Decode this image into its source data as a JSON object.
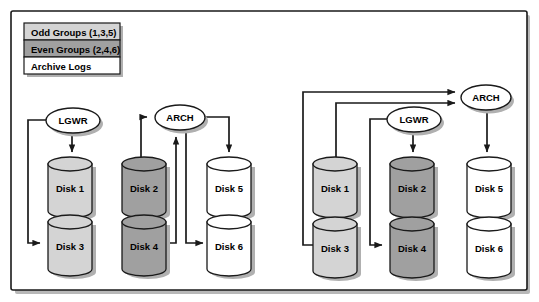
{
  "figure": {
    "colors": {
      "odd_group_fill": "#d4d4d4",
      "even_group_fill": "#a0a0a0",
      "archive_log_fill": "#ffffff",
      "outline": "#1a1a1a",
      "shadow": "#b0b0b0",
      "background": "#ffffff"
    }
  },
  "legend": {
    "items": [
      {
        "label": "Odd Groups (1,3,5)",
        "swatch": "#d4d4d4"
      },
      {
        "label": "Even Groups (2,4,6)",
        "swatch": "#a0a0a0"
      },
      {
        "label": "Archive Logs",
        "swatch": "#ffffff"
      }
    ]
  },
  "left_diagram": {
    "name": "configuration-a",
    "nodes": [
      {
        "id": "lgwr",
        "label": "LGWR"
      },
      {
        "id": "arch",
        "label": "ARCH"
      }
    ],
    "disks": [
      {
        "id": "disk1",
        "label": "Disk 1",
        "group": "odd"
      },
      {
        "id": "disk3",
        "label": "Disk 3",
        "group": "odd"
      },
      {
        "id": "disk2",
        "label": "Disk 2",
        "group": "even"
      },
      {
        "id": "disk4",
        "label": "Disk 4",
        "group": "even"
      },
      {
        "id": "disk5",
        "label": "Disk 5",
        "group": "archive"
      },
      {
        "id": "disk6",
        "label": "Disk 6",
        "group": "archive"
      }
    ],
    "flows": [
      {
        "from": "lgwr",
        "to": "disk1"
      },
      {
        "from": "lgwr",
        "to": "disk3"
      },
      {
        "from": "disk2",
        "to": "arch"
      },
      {
        "from": "disk4",
        "to": "arch"
      },
      {
        "from": "arch",
        "to": "disk5"
      },
      {
        "from": "arch",
        "to": "disk6"
      }
    ]
  },
  "right_diagram": {
    "name": "configuration-b",
    "nodes": [
      {
        "id": "lgwr",
        "label": "LGWR"
      },
      {
        "id": "arch",
        "label": "ARCH"
      }
    ],
    "disks": [
      {
        "id": "disk1",
        "label": "Disk 1",
        "group": "odd"
      },
      {
        "id": "disk3",
        "label": "Disk 3",
        "group": "odd"
      },
      {
        "id": "disk2",
        "label": "Disk 2",
        "group": "even"
      },
      {
        "id": "disk4",
        "label": "Disk 4",
        "group": "even"
      },
      {
        "id": "disk5",
        "label": "Disk 5",
        "group": "archive"
      },
      {
        "id": "disk6",
        "label": "Disk 6",
        "group": "archive"
      }
    ],
    "flows": [
      {
        "from": "lgwr",
        "to": "disk2"
      },
      {
        "from": "lgwr",
        "to": "disk4"
      },
      {
        "from": "disk1",
        "to": "arch"
      },
      {
        "from": "disk3",
        "to": "arch"
      },
      {
        "from": "arch",
        "to": "disk5"
      }
    ]
  }
}
